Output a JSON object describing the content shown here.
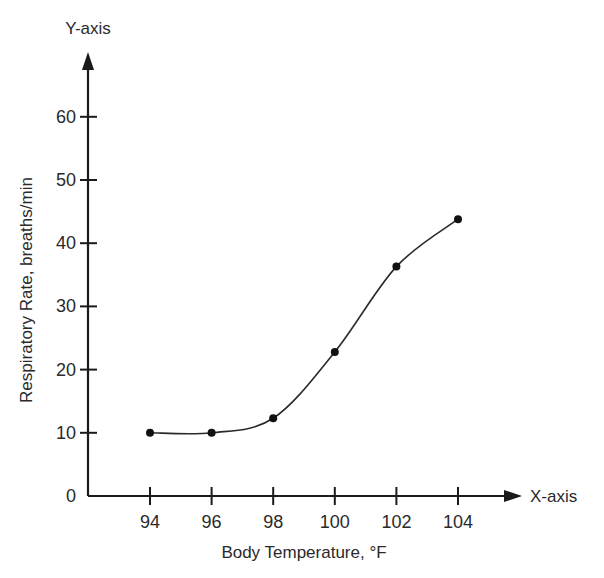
{
  "chart_data": {
    "type": "line",
    "title": "",
    "xlabel": "Body Temperature, °F",
    "ylabel": "Respiratory Rate, breaths/min",
    "x_axis_name": "X-axis",
    "y_axis_name": "Y-axis",
    "x": [
      94,
      96,
      98,
      100,
      102,
      104
    ],
    "series": [
      {
        "name": "Respiratory Rate",
        "values": [
          10,
          10,
          12.3,
          22.8,
          36.3,
          43.8
        ]
      }
    ],
    "x_ticks": [
      "94",
      "96",
      "98",
      "100",
      "102",
      "104"
    ],
    "y_ticks": [
      "0",
      "10",
      "20",
      "30",
      "40",
      "50",
      "60"
    ],
    "xlim": [
      91,
      106
    ],
    "ylim": [
      0,
      65
    ],
    "grid": false,
    "legend": null,
    "smooth_curve": true
  }
}
